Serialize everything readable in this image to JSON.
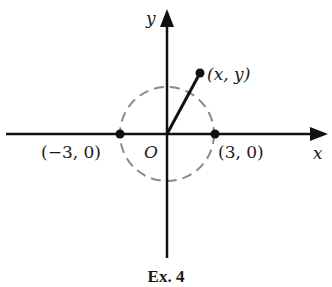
{
  "diagram": {
    "axes": {
      "x_label": "x",
      "y_label": "y",
      "origin_label": "O"
    },
    "circle": {
      "center": [
        0,
        0
      ],
      "radius": 3,
      "style": "dashed",
      "color": "#8a8a8a"
    },
    "points": [
      {
        "label": "(−3, 0)",
        "coords": [
          -3,
          0
        ]
      },
      {
        "label": "(3, 0)",
        "coords": [
          3,
          0
        ]
      },
      {
        "label": "(x, y)",
        "coords": [
          "x",
          "y"
        ]
      }
    ],
    "segment": {
      "from": "O",
      "to": "(x, y)"
    },
    "caption": "Ex. 4"
  }
}
